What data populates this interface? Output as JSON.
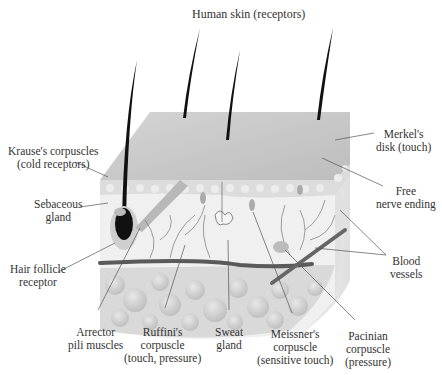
{
  "figure": {
    "title": "Human skin (receptors)",
    "caption_fragment": ""
  },
  "labels": {
    "krause": {
      "line1": "Krause's corpuscles",
      "line2": "(cold receptors)"
    },
    "sebaceous": {
      "line1": "Sebaceous",
      "line2": "gland"
    },
    "hair_follicle": {
      "line1": "Hair follicle",
      "line2": "receptor"
    },
    "merkel": {
      "line1": "Merkel's",
      "line2": "disk (touch)"
    },
    "free_nerve": {
      "line1": "Free",
      "line2": "nerve ending"
    },
    "blood_vessels": {
      "line1": "Blood",
      "line2": "vessels"
    },
    "arrector": {
      "line1": "Arrector",
      "line2": "pili muscles"
    },
    "ruffini": {
      "line1": "Ruffini's",
      "line2": "corpuscle",
      "line3": "(touch, pressure)"
    },
    "sweat": {
      "line1": "Sweat",
      "line2": "gland"
    },
    "meissner": {
      "line1": "Meissner's",
      "line2": "corpuscle",
      "line3": "(sensitive touch)"
    },
    "pacinian": {
      "line1": "Pacinian",
      "line2": "corpuscle",
      "line3": "(pressure)"
    }
  },
  "colors": {
    "epidermis_top": "#c9c9c9",
    "skin_block": "#e6e6e6",
    "fat_cells": "#d2d2d2",
    "hair": "#111111",
    "vessel": "#555555",
    "leader_line": "#555555"
  }
}
